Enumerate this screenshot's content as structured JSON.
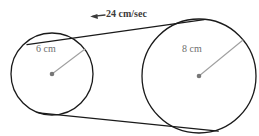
{
  "figure": {
    "type": "pulley-belt-diagram",
    "background_color": "#ffffff",
    "stroke_color": "#1a1a1a",
    "radius_line_color": "#9a9a9a",
    "center_dot_color": "#777777",
    "label_color": "#6e6e6e",
    "speed_label_color": "#3b3b3b",
    "belt_speed": {
      "label": "24 cm/sec",
      "value": 24,
      "unit": "cm/sec",
      "arrow_direction": "left",
      "arrow_icon": "arrow-left-icon"
    },
    "pulleys": [
      {
        "id": "left-pulley",
        "radius_label": "6 cm",
        "radius_value": 6,
        "unit": "cm",
        "cx": 52,
        "cy": 74,
        "r": 41
      },
      {
        "id": "right-pulley",
        "radius_label": "8 cm",
        "radius_value": 8,
        "unit": "cm",
        "cx": 199,
        "cy": 76,
        "r": 57
      }
    ]
  }
}
